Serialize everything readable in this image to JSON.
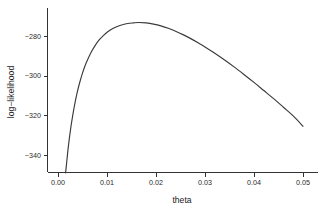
{
  "chart_data": {
    "type": "line",
    "title": "",
    "subtitle": "",
    "xlabel": "theta",
    "ylabel": "log-likelihood",
    "xlim": [
      -0.0012,
      0.0512
    ],
    "ylim": [
      -351.5,
      -268.0
    ],
    "xticks": [
      0.0,
      0.01,
      0.02,
      0.03,
      0.04,
      0.05
    ],
    "xticklabels": [
      "0.00",
      "0.01",
      "0.02",
      "0.03",
      "0.04",
      "0.05"
    ],
    "yticks": [
      -280,
      -300,
      -320,
      -340
    ],
    "yticklabels": [
      "-280",
      "-300",
      "-320",
      "-340"
    ],
    "grid": false,
    "legend": null,
    "legend_position": "none",
    "line_color": "#3a3a3a",
    "line_width": 1.15,
    "background_color": "#ffffff",
    "axis_color": "#333333",
    "annotations": [],
    "series": [
      {
        "name": "log-likelihood",
        "x": [
          0.00155,
          0.00175,
          0.002,
          0.0023,
          0.00265,
          0.003,
          0.0034,
          0.00385,
          0.00435,
          0.0049,
          0.0055,
          0.00615,
          0.00685,
          0.0076,
          0.0084,
          0.00925,
          0.01015,
          0.0111,
          0.0121,
          0.01315,
          0.01425,
          0.0154,
          0.0165,
          0.018,
          0.0195,
          0.021,
          0.0225,
          0.024,
          0.0255,
          0.027,
          0.0285,
          0.03,
          0.032,
          0.034,
          0.036,
          0.038,
          0.04,
          0.042,
          0.044,
          0.046,
          0.048,
          0.05
        ],
        "y": [
          -349.0,
          -344.3,
          -338.2,
          -331.9,
          -325.6,
          -320.1,
          -314.6,
          -309.2,
          -304.2,
          -299.5,
          -295.1,
          -291.3,
          -287.8,
          -284.7,
          -282.0,
          -279.8,
          -277.9,
          -276.4,
          -275.2,
          -274.3,
          -273.7,
          -273.4,
          -273.2,
          -273.4,
          -274.0,
          -274.9,
          -276.1,
          -277.6,
          -279.3,
          -281.2,
          -283.3,
          -285.5,
          -288.7,
          -292.1,
          -295.7,
          -299.5,
          -303.4,
          -307.5,
          -311.6,
          -315.9,
          -320.3,
          -325.5
        ]
      }
    ],
    "maximum": {
      "x": 0.0165,
      "y": -273.2
    }
  },
  "plot_geometry": {
    "panel_left_px": 47,
    "panel_bottom_px": 172,
    "panel_right_px": 318,
    "panel_top_px": 8,
    "x_px_at_0": 58,
    "x_px_at_0p05": 303,
    "y_px_at_minus280": 36,
    "y_px_at_minus340": 155
  }
}
